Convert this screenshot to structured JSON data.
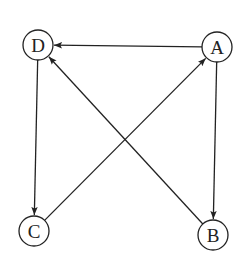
{
  "diagram": {
    "type": "directed-graph",
    "stroke_color": "#222222",
    "background": "#ffffff",
    "node_radius": 15,
    "nodes": [
      {
        "id": "D",
        "label": "D",
        "x": 38,
        "y": 45
      },
      {
        "id": "A",
        "label": "A",
        "x": 217,
        "y": 47
      },
      {
        "id": "C",
        "label": "C",
        "x": 34,
        "y": 231
      },
      {
        "id": "B",
        "label": "B",
        "x": 213,
        "y": 235
      }
    ],
    "edges": [
      {
        "from": "A",
        "to": "D"
      },
      {
        "from": "D",
        "to": "C"
      },
      {
        "from": "A",
        "to": "B"
      },
      {
        "from": "B",
        "to": "D"
      },
      {
        "from": "C",
        "to": "A"
      }
    ]
  }
}
